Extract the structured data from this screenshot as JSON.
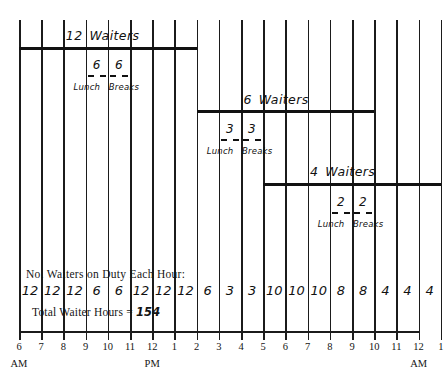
{
  "chart_data": {
    "type": "bar",
    "xlabel": "Hour of day",
    "ylabel": "",
    "grid": true,
    "legend": "none",
    "axis": {
      "tick_labels": [
        "6",
        "7",
        "8",
        "9",
        "10",
        "11",
        "12",
        "1",
        "2",
        "3",
        "4",
        "5",
        "6",
        "7",
        "8",
        "9",
        "10",
        "11",
        "12",
        "1"
      ],
      "meridiem_marks": [
        {
          "index": 0,
          "text": "AM"
        },
        {
          "index": 6,
          "text": "PM"
        },
        {
          "index": 18,
          "text": "AM"
        }
      ],
      "start_hour_label": "6 AM",
      "end_hour_label": "1 AM"
    },
    "categories": [
      "6 AM",
      "7 AM",
      "8 AM",
      "9 AM",
      "10 AM",
      "11 AM",
      "12 PM",
      "1 PM",
      "2 PM",
      "3 PM",
      "4 PM",
      "5 PM",
      "6 PM",
      "7 PM",
      "8 PM",
      "9 PM",
      "10 PM",
      "11 PM",
      "12 AM"
    ],
    "values": [
      12,
      12,
      12,
      6,
      6,
      12,
      12,
      12,
      6,
      3,
      3,
      10,
      10,
      10,
      8,
      8,
      4,
      4,
      4
    ],
    "total": 154,
    "shifts": [
      {
        "id": "shift-1",
        "count": "12",
        "label": "Waiters",
        "start_index": 0,
        "end_index": 8,
        "breaks": [
          {
            "count": "6",
            "start_index": 3,
            "end_index": 4
          },
          {
            "count": "6",
            "start_index": 4,
            "end_index": 5
          }
        ],
        "break_label_left": "Lunch",
        "break_label_right": "Breaks"
      },
      {
        "id": "shift-2",
        "count": "6",
        "label": "Waiters",
        "start_index": 8,
        "end_index": 16,
        "breaks": [
          {
            "count": "3",
            "start_index": 9,
            "end_index": 10
          },
          {
            "count": "3",
            "start_index": 10,
            "end_index": 11
          }
        ],
        "break_label_left": "Lunch",
        "break_label_right": "Breaks"
      },
      {
        "id": "shift-3",
        "count": "4",
        "label": "Waiters",
        "start_index": 11,
        "end_index": 19,
        "breaks": [
          {
            "count": "2",
            "start_index": 14,
            "end_index": 15
          },
          {
            "count": "2",
            "start_index": 15,
            "end_index": 16
          }
        ],
        "break_label_left": "Lunch",
        "break_label_right": "Breaks"
      }
    ]
  },
  "summary": {
    "duty_title": "No. Waiters on Duty Each Hour:",
    "total_label": "Total Waiter Hours  =",
    "total_value": "154"
  },
  "colors": {
    "ink": "#111111",
    "paper": "#ffffff"
  }
}
